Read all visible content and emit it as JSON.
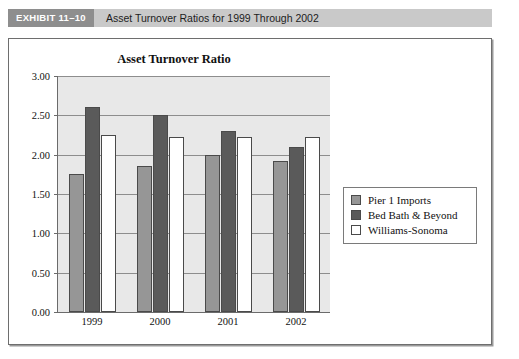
{
  "exhibit": {
    "tag": "EXHIBIT 11–10",
    "title": "Asset Turnover Ratios for 1999 Through 2002"
  },
  "legend": {
    "position": "right"
  },
  "chart_data": {
    "type": "bar",
    "title": "Asset Turnover Ratio",
    "xlabel": "",
    "ylabel": "",
    "categories": [
      "1999",
      "2000",
      "2001",
      "2002"
    ],
    "series": [
      {
        "name": "Pier 1 Imports",
        "color": "#969696",
        "values": [
          1.75,
          1.85,
          2.0,
          1.92
        ]
      },
      {
        "name": "Bed Bath & Beyond",
        "color": "#5a5a5a",
        "values": [
          2.6,
          2.5,
          2.3,
          2.1
        ]
      },
      {
        "name": "Williams-Sonoma",
        "color": "#ffffff",
        "values": [
          2.25,
          2.22,
          2.22,
          2.22
        ]
      }
    ],
    "ylim": [
      0.0,
      3.0
    ],
    "ytick_labels": [
      "0.00",
      "0.50",
      "1.00",
      "1.50",
      "2.00",
      "2.50",
      "3.00"
    ],
    "ytick_values": [
      0.0,
      0.5,
      1.0,
      1.5,
      2.0,
      2.5,
      3.0
    ],
    "grid": true,
    "legend_position": "right",
    "plot_background": "#e8e8e8"
  }
}
